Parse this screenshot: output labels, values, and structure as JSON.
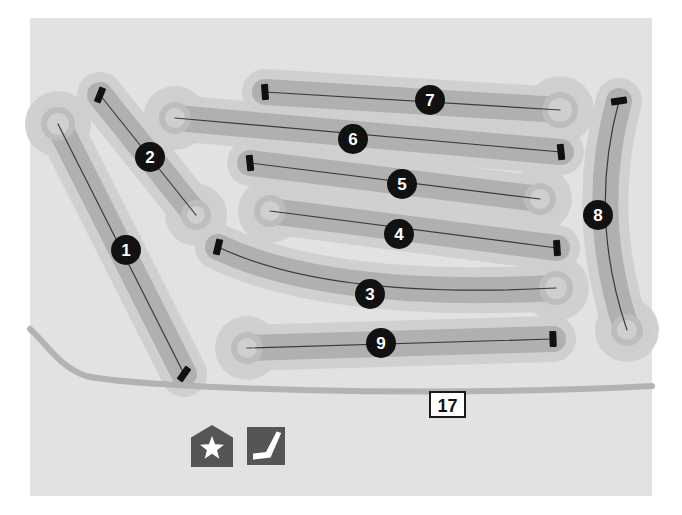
{
  "map": {
    "title": "Golf Course Layout Map",
    "frame": {
      "x": 30,
      "y": 18,
      "width": 622,
      "height": 478
    },
    "colors": {
      "page_background": "#ffffff",
      "map_background": "#e2e2e2",
      "rough": "#cfcfcf",
      "fairway": "#b0b0b0",
      "green_ring": "#bdbdbd",
      "green_fill": "#cfcfcf",
      "road": "#b3b3b3",
      "center_line": "#3a3a3a",
      "tee_marker": "#111111",
      "badge_fill": "#111111",
      "badge_text": "#ffffff",
      "shield_fill": "#ffffff",
      "shield_border": "#1a1a1a",
      "shield_text": "#111111",
      "legend_icon_fill": "#555555",
      "legend_glyph": "#ffffff"
    }
  },
  "holes": [
    {
      "number": "1",
      "badge": {
        "cx": 126,
        "cy": 250,
        "r": 15
      },
      "tee": {
        "x": 184,
        "y": 374,
        "angle": 35
      },
      "green": {
        "cx": 58,
        "cy": 124,
        "r": 17
      },
      "path": "M 184 374 L 58 124",
      "corridor": "M 184 374 L 58 124"
    },
    {
      "number": "2",
      "badge": {
        "cx": 150,
        "cy": 157,
        "r": 15
      },
      "tee": {
        "x": 100,
        "y": 95,
        "angle": 22
      },
      "green": {
        "cx": 196,
        "cy": 215,
        "r": 15
      },
      "path": "M 100 95 L 196 215",
      "corridor": "M 100 95 L 196 215"
    },
    {
      "number": "3",
      "badge": {
        "cx": 370,
        "cy": 294,
        "r": 15
      },
      "tee": {
        "x": 218,
        "y": 247,
        "angle": 14
      },
      "green": {
        "cx": 556,
        "cy": 288,
        "r": 17
      },
      "path": "M 218 247 Q 330 300 556 288",
      "corridor": "M 218 247 Q 330 300 556 288"
    },
    {
      "number": "4",
      "badge": {
        "cx": 399,
        "cy": 234,
        "r": 15
      },
      "tee": {
        "x": 557,
        "y": 248,
        "angle": -4
      },
      "green": {
        "cx": 270,
        "cy": 211,
        "r": 16
      },
      "path": "M 270 211 L 557 248",
      "corridor": "M 270 211 L 557 248"
    },
    {
      "number": "5",
      "badge": {
        "cx": 402,
        "cy": 184,
        "r": 15
      },
      "tee": {
        "x": 250,
        "y": 163,
        "angle": -6
      },
      "green": {
        "cx": 540,
        "cy": 199,
        "r": 16
      },
      "path": "M 250 163 L 540 199",
      "corridor": "M 250 163 L 540 199"
    },
    {
      "number": "6",
      "badge": {
        "cx": 353,
        "cy": 139,
        "r": 15
      },
      "tee": {
        "x": 561,
        "y": 152,
        "angle": -6
      },
      "green": {
        "cx": 175,
        "cy": 118,
        "r": 16
      },
      "path": "M 175 118 L 561 152",
      "corridor": "M 175 118 L 561 152"
    },
    {
      "number": "7",
      "badge": {
        "cx": 430,
        "cy": 100,
        "r": 15
      },
      "tee": {
        "x": 265,
        "y": 92,
        "angle": -4
      },
      "green": {
        "cx": 560,
        "cy": 110,
        "r": 18
      },
      "path": "M 265 92 L 560 110",
      "corridor": "M 265 92 L 560 110"
    },
    {
      "number": "8",
      "badge": {
        "cx": 598,
        "cy": 215,
        "r": 15
      },
      "tee": {
        "x": 619,
        "y": 101,
        "angle": 82
      },
      "green": {
        "cx": 627,
        "cy": 330,
        "r": 16
      },
      "path": "M 619 101 Q 588 215 627 330",
      "corridor": "M 619 101 Q 588 215 627 330"
    },
    {
      "number": "9",
      "badge": {
        "cx": 381,
        "cy": 343,
        "r": 15
      },
      "tee": {
        "x": 553,
        "y": 339,
        "angle": -2
      },
      "green": {
        "cx": 247,
        "cy": 348,
        "r": 16
      },
      "path": "M 247 348 L 553 339",
      "corridor": "M 247 348 L 553 339"
    }
  ],
  "road": {
    "name": "State Route 17",
    "path": "M 30 329 C 48 345 58 366 86 376 C 140 388 420 398 652 386",
    "shield": {
      "label": "17",
      "x": 430,
      "y": 392,
      "width": 35,
      "height": 25
    }
  },
  "legend": {
    "items": [
      {
        "name": "clubhouse",
        "icon": "house-star-icon",
        "x": 191,
        "y": 425,
        "size": 42
      },
      {
        "name": "driving-range",
        "icon": "golf-club-icon",
        "x": 247,
        "y": 427,
        "size": 38
      }
    ]
  }
}
